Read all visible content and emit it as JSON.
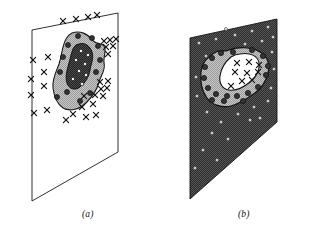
{
  "figure": {
    "background_color": "#ffffff",
    "width": 321,
    "height": 243
  },
  "captions": {
    "panel_a": "(a)",
    "panel_b": "(b)"
  },
  "colors": {
    "outline": "#1a1a1a",
    "white": "#ffffff",
    "mid_gray": "#b5b5b5",
    "dark_gray": "#3a3a3a",
    "near_black": "#2b2b2b",
    "marker_dot_dark": "#333333",
    "marker_dot_light": "#f2f2f2"
  },
  "panel_a": {
    "label": "(a)",
    "plane_fill": "#ffffff",
    "plane_vertices": "32,30 118,13 118,152 32,201",
    "outer_region_fill": "#b5b5b5",
    "outer_region_path": "M 72,33 C 80,30 88,34 92,40 C 97,45 101,42 104,46 C 107,51 103,57 104,63 C 106,70 101,75 99,82 C 97,90 92,97 86,103 C 80,109 70,112 63,108 C 57,104 54,96 53,88 C 52,79 56,72 59,64 C 62,55 62,46 66,39 C 68,35 70,34 72,33 Z",
    "inner_region_fill": "#2b2b2b",
    "inner_region_path": "M 79,44 C 85,42 90,46 92,52 C 94,58 91,64 90,70 C 89,77 85,83 80,87 C 75,91 69,89 67,83 C 65,77 67,70 69,63 C 71,56 72,48 76,45 Z",
    "x_markers": [
      {
        "x": 63,
        "y": 21
      },
      {
        "x": 76,
        "y": 19
      },
      {
        "x": 88,
        "y": 17
      },
      {
        "x": 97,
        "y": 15
      },
      {
        "x": 104,
        "y": 41
      },
      {
        "x": 110,
        "y": 40
      },
      {
        "x": 116,
        "y": 39
      },
      {
        "x": 106,
        "y": 47
      },
      {
        "x": 113,
        "y": 46
      },
      {
        "x": 108,
        "y": 54
      },
      {
        "x": 48,
        "y": 57
      },
      {
        "x": 33,
        "y": 60
      },
      {
        "x": 44,
        "y": 72
      },
      {
        "x": 31,
        "y": 79
      },
      {
        "x": 44,
        "y": 86
      },
      {
        "x": 31,
        "y": 95
      },
      {
        "x": 34,
        "y": 113
      },
      {
        "x": 47,
        "y": 110
      },
      {
        "x": 100,
        "y": 82
      },
      {
        "x": 108,
        "y": 81
      },
      {
        "x": 101,
        "y": 89
      },
      {
        "x": 107,
        "y": 88
      },
      {
        "x": 84,
        "y": 96
      },
      {
        "x": 95,
        "y": 95
      },
      {
        "x": 82,
        "y": 107
      },
      {
        "x": 93,
        "y": 104
      },
      {
        "x": 103,
        "y": 96
      },
      {
        "x": 73,
        "y": 114
      },
      {
        "x": 86,
        "y": 117
      },
      {
        "x": 96,
        "y": 115
      },
      {
        "x": 66,
        "y": 120
      }
    ],
    "dark_dot_markers": [
      {
        "x": 78,
        "y": 36
      },
      {
        "x": 92,
        "y": 38
      },
      {
        "x": 98,
        "y": 46
      },
      {
        "x": 68,
        "y": 45
      },
      {
        "x": 100,
        "y": 60
      },
      {
        "x": 96,
        "y": 72
      },
      {
        "x": 63,
        "y": 57
      },
      {
        "x": 60,
        "y": 72
      },
      {
        "x": 67,
        "y": 92
      },
      {
        "x": 80,
        "y": 101
      },
      {
        "x": 90,
        "y": 93
      },
      {
        "x": 57,
        "y": 97
      }
    ],
    "light_dot_markers": [
      {
        "x": 81,
        "y": 51
      },
      {
        "x": 88,
        "y": 55
      },
      {
        "x": 76,
        "y": 60
      },
      {
        "x": 85,
        "y": 64
      },
      {
        "x": 79,
        "y": 71
      },
      {
        "x": 86,
        "y": 75
      },
      {
        "x": 73,
        "y": 79
      },
      {
        "x": 82,
        "y": 84
      }
    ]
  },
  "panel_b": {
    "label": "(b)",
    "plane_fill": "#3a3a3a",
    "plane_vertices": "190,38 277,19 277,122 190,199",
    "outer_region_fill": "#b5b5b5",
    "outer_region_path": "M 226,51 C 238,46 252,47 260,52 C 268,57 270,65 268,73 C 266,81 262,88 255,93 C 248,98 240,104 231,106 C 222,108 212,105 207,98 C 202,91 200,81 201,72 C 202,63 208,56 216,52 C 219,50 223,51 226,51 Z",
    "inner_region_fill": "#ffffff",
    "inner_region_path": "M 240,54 C 250,52 258,56 259,63 C 260,70 256,77 250,82 C 244,87 236,91 229,90 C 222,89 219,83 220,76 C 221,69 225,62 231,57 C 234,55 237,54 240,54 Z",
    "x_markers": [
      {
        "x": 237,
        "y": 63
      },
      {
        "x": 249,
        "y": 62
      },
      {
        "x": 259,
        "y": 65
      },
      {
        "x": 235,
        "y": 72
      },
      {
        "x": 247,
        "y": 73
      },
      {
        "x": 258,
        "y": 72
      },
      {
        "x": 242,
        "y": 81
      },
      {
        "x": 252,
        "y": 80
      },
      {
        "x": 231,
        "y": 86
      }
    ],
    "dark_dot_markers": [
      {
        "x": 233,
        "y": 52
      },
      {
        "x": 252,
        "y": 50
      },
      {
        "x": 263,
        "y": 56
      },
      {
        "x": 268,
        "y": 66
      },
      {
        "x": 266,
        "y": 75
      },
      {
        "x": 258,
        "y": 87
      },
      {
        "x": 248,
        "y": 93
      },
      {
        "x": 237,
        "y": 96
      },
      {
        "x": 227,
        "y": 96
      },
      {
        "x": 216,
        "y": 94
      },
      {
        "x": 208,
        "y": 88
      },
      {
        "x": 204,
        "y": 78
      },
      {
        "x": 205,
        "y": 67
      },
      {
        "x": 212,
        "y": 58
      },
      {
        "x": 221,
        "y": 53
      },
      {
        "x": 224,
        "y": 101
      },
      {
        "x": 243,
        "y": 101
      },
      {
        "x": 212,
        "y": 100
      }
    ],
    "light_dot_markers": [
      {
        "x": 199,
        "y": 43
      },
      {
        "x": 216,
        "y": 39
      },
      {
        "x": 235,
        "y": 35
      },
      {
        "x": 252,
        "y": 31
      },
      {
        "x": 268,
        "y": 27
      },
      {
        "x": 206,
        "y": 56
      },
      {
        "x": 226,
        "y": 29
      },
      {
        "x": 245,
        "y": 44
      },
      {
        "x": 262,
        "y": 41
      },
      {
        "x": 273,
        "y": 37
      },
      {
        "x": 272,
        "y": 52
      },
      {
        "x": 274,
        "y": 69
      },
      {
        "x": 271,
        "y": 88
      },
      {
        "x": 268,
        "y": 101
      },
      {
        "x": 254,
        "y": 107
      },
      {
        "x": 238,
        "y": 114
      },
      {
        "x": 221,
        "y": 122
      },
      {
        "x": 207,
        "y": 112
      },
      {
        "x": 197,
        "y": 96
      },
      {
        "x": 196,
        "y": 77
      },
      {
        "x": 212,
        "y": 133
      },
      {
        "x": 228,
        "y": 139
      },
      {
        "x": 203,
        "y": 150
      },
      {
        "x": 217,
        "y": 160
      },
      {
        "x": 195,
        "y": 168
      },
      {
        "x": 250,
        "y": 120
      },
      {
        "x": 260,
        "y": 118
      }
    ]
  }
}
